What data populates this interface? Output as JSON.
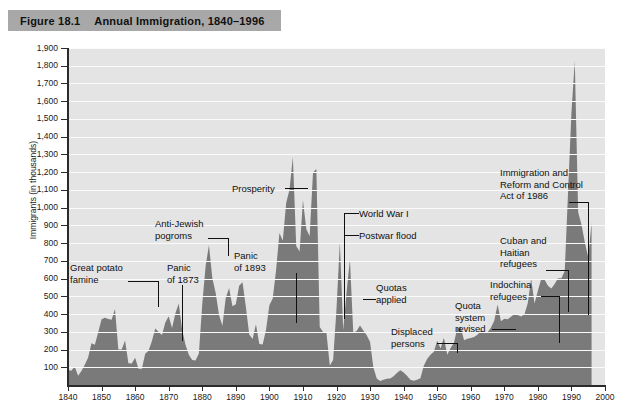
{
  "figure": {
    "number": "Figure 18.1",
    "title": "Annual Immigration, 1840–1996"
  },
  "axes": {
    "y_title": "Immigrants (in thousands)",
    "y_ticks": [
      "1,900",
      "1,800",
      "1,700",
      "1,600",
      "1,500",
      "1,400",
      "1,300",
      "1,200",
      "1,100",
      "1,000",
      "900",
      "800",
      "700",
      "600",
      "500",
      "400",
      "300",
      "200",
      "100"
    ],
    "x_ticks": [
      "1840",
      "1850",
      "1860",
      "1870",
      "1880",
      "1890",
      "1900",
      "1910",
      "1920",
      "1930",
      "1940",
      "1950",
      "1960",
      "1970",
      "1980",
      "1990",
      "2000"
    ]
  },
  "annotations": [
    {
      "id": "great-potato-famine",
      "text": "Great potato\nfamine"
    },
    {
      "id": "panic-of-1873",
      "text": "Panic\nof 1873"
    },
    {
      "id": "anti-jewish-pogroms",
      "text": "Anti-Jewish\npogroms"
    },
    {
      "id": "panic-of-1893",
      "text": "Panic\nof 1893"
    },
    {
      "id": "prosperity",
      "text": "Prosperity"
    },
    {
      "id": "world-war-i",
      "text": "World War I"
    },
    {
      "id": "postwar-flood",
      "text": "Postwar flood"
    },
    {
      "id": "quotas-applied",
      "text": "Quotas\napplied"
    },
    {
      "id": "displaced-persons",
      "text": "Displaced\npersons"
    },
    {
      "id": "quota-system-revised",
      "text": "Quota\nsystem\nrevised"
    },
    {
      "id": "immigration-reform-control-act",
      "text": "Immigration and\nReform and Control\nAct of 1986"
    },
    {
      "id": "cuban-haitian-refugees",
      "text": "Cuban and\nHaitian\nrefugees"
    },
    {
      "id": "indochina-refugees",
      "text": "Indochina\nrefugees"
    }
  ],
  "colors": {
    "title_bar": "#a8a8a8",
    "plot_background": "#e4e4e4",
    "gridline": "#fbfbfb",
    "area_fill": "#7a7a7a",
    "axis": "#2b2b2b",
    "text": "#101010"
  },
  "chart_data": {
    "type": "area",
    "title": "Annual Immigration, 1840–1996",
    "xlabel": "",
    "ylabel": "Immigrants (in thousands)",
    "xlim": [
      1840,
      2000
    ],
    "ylim": [
      0,
      1900
    ],
    "grid": true,
    "legend": "none",
    "units": "thousands of immigrants per year",
    "x": [
      1840,
      1841,
      1842,
      1843,
      1844,
      1845,
      1846,
      1847,
      1848,
      1849,
      1850,
      1851,
      1852,
      1853,
      1854,
      1855,
      1856,
      1857,
      1858,
      1859,
      1860,
      1861,
      1862,
      1863,
      1864,
      1865,
      1866,
      1867,
      1868,
      1869,
      1870,
      1871,
      1872,
      1873,
      1874,
      1875,
      1876,
      1877,
      1878,
      1879,
      1880,
      1881,
      1882,
      1883,
      1884,
      1885,
      1886,
      1887,
      1888,
      1889,
      1890,
      1891,
      1892,
      1893,
      1894,
      1895,
      1896,
      1897,
      1898,
      1899,
      1900,
      1901,
      1902,
      1903,
      1904,
      1905,
      1906,
      1907,
      1908,
      1909,
      1910,
      1911,
      1912,
      1913,
      1914,
      1915,
      1916,
      1917,
      1918,
      1919,
      1920,
      1921,
      1922,
      1923,
      1924,
      1925,
      1926,
      1927,
      1928,
      1929,
      1930,
      1931,
      1932,
      1933,
      1934,
      1935,
      1936,
      1937,
      1938,
      1939,
      1940,
      1941,
      1942,
      1943,
      1944,
      1945,
      1946,
      1947,
      1948,
      1949,
      1950,
      1951,
      1952,
      1953,
      1954,
      1955,
      1956,
      1957,
      1958,
      1959,
      1960,
      1961,
      1962,
      1963,
      1964,
      1965,
      1966,
      1967,
      1968,
      1969,
      1970,
      1971,
      1972,
      1973,
      1974,
      1975,
      1976,
      1977,
      1978,
      1979,
      1980,
      1981,
      1982,
      1983,
      1984,
      1985,
      1986,
      1987,
      1988,
      1989,
      1990,
      1991,
      1992,
      1993,
      1994,
      1995,
      1996
    ],
    "values": [
      84,
      80,
      105,
      52,
      79,
      114,
      155,
      235,
      227,
      298,
      370,
      379,
      372,
      368,
      428,
      200,
      200,
      251,
      123,
      121,
      154,
      92,
      92,
      176,
      193,
      248,
      319,
      299,
      282,
      352,
      387,
      321,
      405,
      460,
      313,
      227,
      170,
      141,
      138,
      178,
      457,
      669,
      789,
      603,
      519,
      395,
      334,
      490,
      547,
      444,
      455,
      560,
      579,
      440,
      285,
      259,
      343,
      231,
      229,
      312,
      449,
      488,
      649,
      857,
      813,
      1026,
      1101,
      1285,
      783,
      752,
      1042,
      879,
      838,
      1198,
      1218,
      327,
      299,
      295,
      110,
      141,
      430,
      805,
      310,
      523,
      707,
      294,
      304,
      335,
      307,
      280,
      242,
      97,
      36,
      23,
      29,
      35,
      36,
      50,
      67,
      83,
      71,
      52,
      29,
      24,
      29,
      38,
      108,
      147,
      170,
      188,
      249,
      206,
      266,
      170,
      208,
      238,
      322,
      327,
      253,
      261,
      265,
      271,
      284,
      306,
      292,
      297,
      323,
      362,
      454,
      359,
      373,
      370,
      385,
      400,
      395,
      386,
      399,
      462,
      601,
      460,
      531,
      597,
      594,
      560,
      544,
      570,
      602,
      602,
      643,
      1091,
      1536,
      1827,
      974,
      904,
      804,
      720,
      916
    ],
    "annotations": [
      {
        "label": "Great potato famine",
        "x": 1852,
        "y": 372
      },
      {
        "label": "Panic of 1873",
        "x": 1873,
        "y": 460
      },
      {
        "label": "Anti-Jewish pogroms",
        "x": 1882,
        "y": 789
      },
      {
        "label": "Panic of 1893",
        "x": 1893,
        "y": 440
      },
      {
        "label": "Prosperity",
        "x": 1907,
        "y": 1285
      },
      {
        "label": "World War I",
        "x": 1915,
        "y": 327
      },
      {
        "label": "Postwar flood",
        "x": 1921,
        "y": 805
      },
      {
        "label": "Quotas applied",
        "x": 1925,
        "y": 294
      },
      {
        "label": "Displaced persons",
        "x": 1949,
        "y": 188
      },
      {
        "label": "Quota system revised",
        "x": 1965,
        "y": 297
      },
      {
        "label": "Immigration and Reform and Control Act of 1986",
        "x": 1989,
        "y": 1091
      },
      {
        "label": "Cuban and Haitian refugees",
        "x": 1980,
        "y": 531
      },
      {
        "label": "Indochina refugees",
        "x": 1975,
        "y": 386
      }
    ]
  }
}
